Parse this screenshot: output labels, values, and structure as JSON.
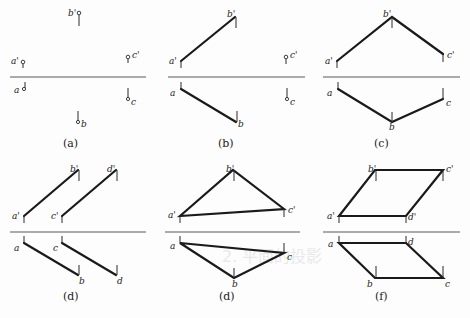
{
  "figure": {
    "background_text": "2.  平面的投影",
    "panels": [
      {
        "id": "a",
        "caption": "(a)",
        "type": "points",
        "labels": {
          "a_v": "a'",
          "b_v": "b'",
          "c_v": "c'",
          "a_h": "a",
          "b_h": "b",
          "c_h": "c"
        }
      },
      {
        "id": "b",
        "caption": "(b)",
        "type": "line-plus-point",
        "labels": {
          "a_v": "a'",
          "b_v": "b'",
          "c_v": "c'",
          "a_h": "a",
          "b_h": "b",
          "c_h": "c"
        }
      },
      {
        "id": "c",
        "caption": "(c)",
        "type": "two-intersecting-lines",
        "labels": {
          "a_v": "a'",
          "b_v": "b'",
          "c_v": "c'",
          "a_h": "a",
          "b_h": "b",
          "c_h": "c"
        }
      },
      {
        "id": "d1",
        "caption": "(d)",
        "type": "two-parallel-lines",
        "labels": {
          "a_v": "a'",
          "b_v": "b'",
          "c_v": "c'",
          "d_v": "d'",
          "a_h": "a",
          "b_h": "b",
          "c_h": "c",
          "d_h": "d"
        }
      },
      {
        "id": "d2",
        "caption": "(d)",
        "type": "triangle",
        "labels": {
          "a_v": "a'",
          "b_v": "b'",
          "c_v": "c'",
          "a_h": "a",
          "b_h": "b",
          "c_h": "c"
        }
      },
      {
        "id": "f",
        "caption": "(f)",
        "type": "parallelogram",
        "labels": {
          "a_v": "a'",
          "b_v": "b'",
          "c_v": "c'",
          "d_v": "d'",
          "a_h": "a",
          "b_h": "b",
          "c_h": "c",
          "d_h": "d"
        }
      }
    ]
  }
}
